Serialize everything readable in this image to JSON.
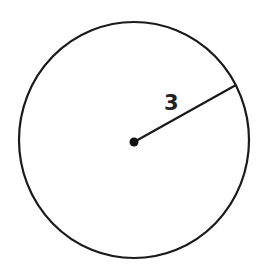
{
  "diagram": {
    "shape": "circle",
    "radius_label": "3",
    "stroke_color": "#1a1a1a",
    "background": "#ffffff"
  }
}
